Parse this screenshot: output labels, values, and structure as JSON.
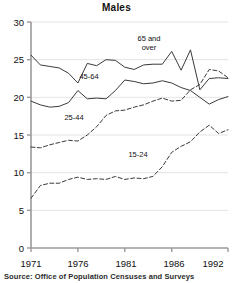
{
  "chart_data": {
    "type": "line",
    "title": "Males",
    "xlabel": "",
    "ylabel": "",
    "xlim": [
      1971,
      1992
    ],
    "ylim": [
      0,
      30
    ],
    "grid": true,
    "legend_position": "inline-annotations",
    "source": "Source: Office of Population Censuses and Surveys",
    "x": [
      1971,
      1972,
      1973,
      1974,
      1975,
      1976,
      1977,
      1978,
      1979,
      1980,
      1981,
      1982,
      1983,
      1984,
      1985,
      1986,
      1987,
      1988,
      1989,
      1990,
      1991,
      1992
    ],
    "xticks": [
      1971,
      1976,
      1981,
      1986,
      1992
    ],
    "yticks": [
      0,
      5,
      10,
      15,
      20,
      25,
      30
    ],
    "series": [
      {
        "name": "65 and over",
        "style": "solid",
        "label_text_line1": "65 and",
        "label_text_line2": "over",
        "values": [
          25.6,
          24.3,
          24.1,
          23.9,
          23.2,
          21.9,
          24.5,
          24.2,
          25.0,
          24.9,
          24.0,
          23.7,
          24.3,
          24.4,
          24.4,
          26.1,
          23.6,
          26.3,
          21.0,
          22.5,
          22.6,
          22.5
        ]
      },
      {
        "name": "45-64",
        "style": "solid",
        "label_text_line1": "45-64",
        "label_text_line2": "",
        "values": [
          19.5,
          19.0,
          18.7,
          18.8,
          19.3,
          20.9,
          19.8,
          19.9,
          19.8,
          20.9,
          22.3,
          22.1,
          21.8,
          21.9,
          22.2,
          21.9,
          21.3,
          20.9,
          20.0,
          19.1,
          19.7,
          20.1
        ]
      },
      {
        "name": "25-44",
        "style": "dashed",
        "label_text_line1": "25-44",
        "label_text_line2": "",
        "values": [
          13.4,
          13.3,
          13.7,
          14.0,
          14.3,
          14.2,
          15.0,
          16.1,
          17.6,
          18.2,
          18.3,
          18.7,
          19.0,
          19.5,
          19.9,
          19.5,
          19.6,
          21.0,
          21.7,
          23.7,
          23.5,
          22.6
        ]
      },
      {
        "name": "15-24",
        "style": "dashed",
        "label_text_line1": "15-24",
        "label_text_line2": "",
        "values": [
          6.6,
          8.3,
          8.6,
          8.6,
          9.1,
          9.4,
          9.1,
          9.2,
          9.1,
          9.5,
          9.1,
          9.3,
          9.2,
          9.5,
          10.8,
          12.7,
          13.5,
          14.1,
          15.4,
          16.3,
          15.2,
          15.7
        ]
      }
    ]
  },
  "axis": {
    "y_tick_labels": [
      "30",
      "25",
      "20",
      "15",
      "10",
      "5",
      "0"
    ],
    "x_tick_labels": [
      "1971",
      "1976",
      "1981",
      "1986",
      "1992"
    ]
  },
  "colors": {
    "line": "#3a3a3a",
    "axis": "#9a9a9a",
    "grid": "#e3e3e8",
    "text": "#111111"
  },
  "source_note": "Source: Office of Population Censuses and Surveys"
}
